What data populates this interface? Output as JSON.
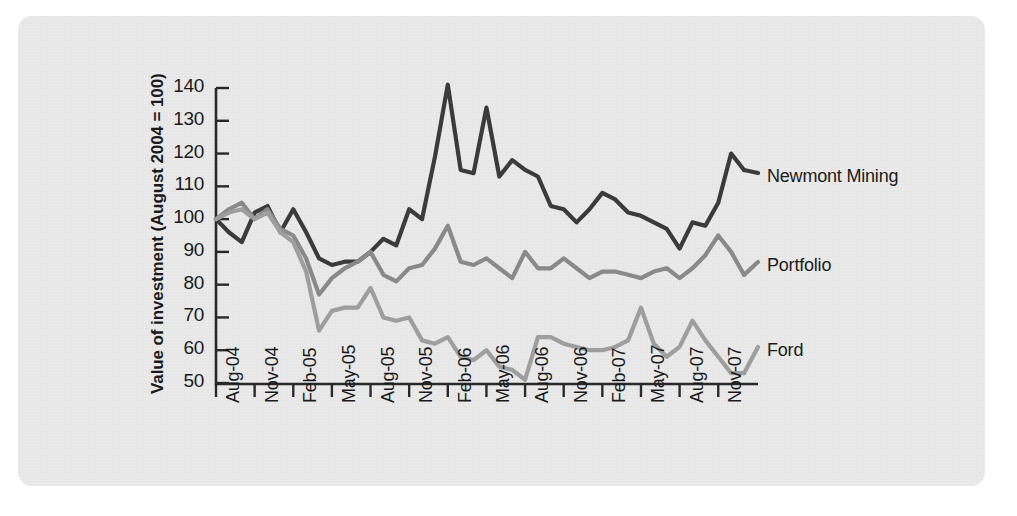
{
  "chart_data": {
    "type": "line",
    "title": "",
    "xlabel": "",
    "ylabel": "Value of investment (August 2004 = 100)",
    "ylim": [
      50,
      140
    ],
    "yticks": [
      50,
      60,
      70,
      80,
      90,
      100,
      110,
      120,
      130,
      140
    ],
    "grid": false,
    "legend_position": "right-inline",
    "x_tick_labels": [
      "Aug-04",
      "Nov-04",
      "Feb-05",
      "May-05",
      "Aug-05",
      "Nov-05",
      "Feb-06",
      "May-06",
      "Aug-06",
      "Nov-06",
      "Feb-07",
      "May-07",
      "Aug-07",
      "Nov-07"
    ],
    "x_months": [
      "Aug-04",
      "Sep-04",
      "Oct-04",
      "Nov-04",
      "Dec-04",
      "Jan-05",
      "Feb-05",
      "Mar-05",
      "Apr-05",
      "May-05",
      "Jun-05",
      "Jul-05",
      "Aug-05",
      "Sep-05",
      "Oct-05",
      "Nov-05",
      "Dec-05",
      "Jan-06",
      "Feb-06",
      "Mar-06",
      "Apr-06",
      "May-06",
      "Jun-06",
      "Jul-06",
      "Aug-06",
      "Sep-06",
      "Oct-06",
      "Nov-06",
      "Dec-06",
      "Jan-07",
      "Feb-07",
      "Mar-07",
      "Apr-07",
      "May-07",
      "Jun-07",
      "Jul-07",
      "Aug-07",
      "Sep-07",
      "Oct-07",
      "Nov-07",
      "Dec-07"
    ],
    "series": [
      {
        "name": "Newmont Mining",
        "color": "#3b3b3b",
        "values": [
          100,
          96,
          93,
          102,
          104,
          96,
          103,
          96,
          88,
          86,
          87,
          87,
          90,
          94,
          92,
          103,
          100,
          119,
          141,
          115,
          114,
          134,
          113,
          118,
          115,
          113,
          104,
          103,
          99,
          103,
          108,
          106,
          102,
          101,
          99,
          97,
          91,
          99,
          98,
          105,
          120,
          115
        ]
      },
      {
        "name": "Portfolio",
        "color": "#8a8a8a",
        "values": [
          100,
          103,
          105,
          100,
          103,
          97,
          95,
          88,
          77,
          82,
          85,
          87,
          90,
          83,
          81,
          85,
          86,
          91,
          98,
          87,
          86,
          88,
          85,
          82,
          90,
          85,
          85,
          88,
          85,
          82,
          84,
          84,
          83,
          82,
          84,
          85,
          82,
          85,
          89,
          95,
          90,
          83
        ]
      },
      {
        "name": "Ford",
        "color": "#9e9e9e",
        "values": [
          100,
          102,
          103,
          100,
          102,
          96,
          93,
          84,
          66,
          72,
          73,
          73,
          79,
          70,
          69,
          70,
          63,
          62,
          64,
          58,
          57,
          60,
          55,
          54,
          51,
          64,
          64,
          62,
          61,
          60,
          60,
          61,
          63,
          73,
          62,
          58,
          61,
          69,
          63,
          58,
          53,
          53
        ]
      }
    ]
  },
  "labels": {
    "newmont": "Newmont Mining",
    "portfolio": "Portfolio",
    "ford": "Ford"
  },
  "colors": {
    "panel_background": "#e6e6e6",
    "page_background": "#ffffff",
    "axis": "#2a2a2a",
    "text": "#1b1b1b",
    "newmont": "#3b3b3b",
    "portfolio": "#8a8a8a",
    "ford": "#9e9e9e"
  }
}
